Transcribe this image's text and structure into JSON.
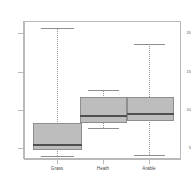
{
  "chart_data": {
    "type": "boxplot",
    "title": "",
    "subtitle": "",
    "xlabel": "",
    "ylabel": "",
    "categories": [
      "Grass",
      "Heath",
      "Arable"
    ],
    "ylim": [
      2,
      22
    ],
    "yticks": [
      5,
      10,
      15,
      20
    ],
    "ytick_labels": [
      "5",
      "10",
      "15",
      "20"
    ],
    "grid": false,
    "legend": "none",
    "series": [
      {
        "name": "Grass",
        "min": 3.2,
        "q1": 4.3,
        "median": 5.2,
        "q3": 8.2,
        "max": 21.0
      },
      {
        "name": "Heath",
        "min": 7.3,
        "q1": 9.7,
        "median": 11.0,
        "q3": 13.2,
        "max": 14.6
      },
      {
        "name": "Arable",
        "min": 3.4,
        "q1": 10.0,
        "median": 11.3,
        "q3": 13.2,
        "max": 18.8
      }
    ],
    "colors": {
      "box_fill": "#bdbdbd",
      "box_border": "#8e8e8e",
      "median": "#4f4f4f",
      "whisker": "#9a9a9a",
      "axis": "#b9b9b9",
      "background": "#ffffff",
      "tick_text": "#4a4a4a"
    }
  },
  "geometry": {
    "note": "pixel positions measured from the screenshot, plot area top=21 bottom=159",
    "yticks_px": [
      148,
      110,
      72,
      33
    ],
    "boxes": [
      {
        "center_x": 57,
        "box_left": 33,
        "box_width": 49,
        "box_top": 123,
        "box_bottom": 150,
        "median_y": 144,
        "whisker_top": 28,
        "whisker_bottom": 156,
        "cap_left": 41,
        "cap_width": 33
      },
      {
        "center_x": 103,
        "box_left": 80,
        "box_width": 47,
        "box_top": 97,
        "box_bottom": 123,
        "median_y": 115,
        "whisker_top": 90,
        "whisker_bottom": 128,
        "cap_left": 88,
        "cap_width": 31
      },
      {
        "center_x": 149,
        "box_left": 127,
        "box_width": 47,
        "box_top": 97,
        "box_bottom": 121,
        "median_y": 113,
        "whisker_top": 44,
        "whisker_bottom": 155,
        "cap_left": 134,
        "cap_width": 31
      }
    ]
  }
}
